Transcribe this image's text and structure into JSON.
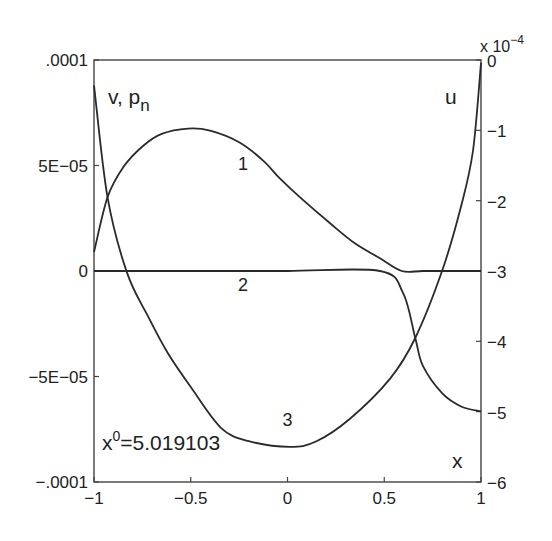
{
  "chart_data": {
    "type": "line",
    "title": "",
    "xlabel": "x",
    "ylabel_left": "v, p_n",
    "ylabel_right": "u",
    "right_axis_multiplier": "x 10^-4",
    "annotation": "x^0=5.019103",
    "xlim": [
      -1,
      1
    ],
    "ylim_left": [
      -0.0001,
      0.0001
    ],
    "ylim_right": [
      -6,
      0
    ],
    "grid": false,
    "x_ticks": [
      {
        "value": -1,
        "label": "-1"
      },
      {
        "value": -0.5,
        "label": "-0.5"
      },
      {
        "value": 0,
        "label": "0"
      },
      {
        "value": 0.5,
        "label": "0.5"
      },
      {
        "value": 1,
        "label": "1"
      }
    ],
    "y_ticks_left": [
      {
        "value": 0.0001,
        "label": ".0001"
      },
      {
        "value": 5e-05,
        "label": "5E-05"
      },
      {
        "value": 0,
        "label": "0"
      },
      {
        "value": -5e-05,
        "label": "-5E-05"
      },
      {
        "value": -0.0001,
        "label": "-.0001"
      }
    ],
    "y_ticks_right": [
      {
        "value": 0,
        "label": "0"
      },
      {
        "value": -1,
        "label": "-1"
      },
      {
        "value": -2,
        "label": "-2"
      },
      {
        "value": -3,
        "label": "-3"
      },
      {
        "value": -4,
        "label": "-4"
      },
      {
        "value": -5,
        "label": "-5"
      },
      {
        "value": -6,
        "label": "-6"
      }
    ],
    "series": [
      {
        "name": "1",
        "axis": "left",
        "label_pos": [
          -0.23,
          4.8e-05
        ],
        "x": [
          -1,
          -0.93,
          -0.85,
          -0.75,
          -0.65,
          -0.514,
          -0.4,
          -0.25,
          -0.127,
          -0.04,
          0.065,
          0.22,
          0.35,
          0.478,
          0.59,
          0.7,
          0.85,
          1
        ],
        "values": [
          9e-06,
          3.5e-05,
          4.9e-05,
          5.9e-05,
          6.5e-05,
          6.75e-05,
          6.65e-05,
          6.1e-05,
          5.24e-05,
          4.39e-05,
          3.49e-05,
          2.26e-05,
          1.3e-05,
          6e-06,
          0,
          0,
          0,
          0
        ]
      },
      {
        "name": "2",
        "axis": "left",
        "label_pos": [
          -0.23,
          -9.5e-06
        ],
        "x": [
          -1,
          -0.5,
          0,
          0.478,
          0.597,
          0.66,
          0.7,
          0.8,
          0.9,
          1
        ],
        "values": [
          0,
          0,
          0,
          0,
          -1.04e-05,
          -3.16e-05,
          -4.5e-05,
          -5.8e-05,
          -6.43e-05,
          -6.65e-05
        ]
      },
      {
        "name": "3",
        "axis": "right",
        "label_pos": [
          0,
          -5.2
        ],
        "x": [
          -1,
          -0.93,
          -0.83,
          -0.72,
          -0.618,
          -0.5,
          -0.344,
          -0.2,
          0.013,
          0.15,
          0.323,
          0.53,
          0.659,
          0.8,
          0.9,
          0.959,
          1
        ],
        "values": [
          -0.36,
          -1.95,
          -3.02,
          -3.65,
          -4.17,
          -4.65,
          -5.23,
          -5.42,
          -5.5,
          -5.42,
          -5.1,
          -4.53,
          -3.96,
          -2.99,
          -2.05,
          -1.28,
          -0.04
        ]
      }
    ]
  }
}
